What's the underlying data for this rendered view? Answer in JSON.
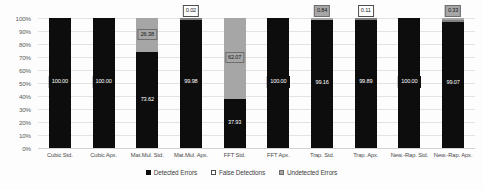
{
  "chart_data": {
    "type": "bar",
    "stacked": true,
    "stack_total": 100,
    "title": "",
    "xlabel": "",
    "ylabel": "",
    "ylim": [
      0,
      100
    ],
    "grid": true,
    "legend_position": "bottom",
    "y_ticks": [
      "0%",
      "10%",
      "20%",
      "30%",
      "40%",
      "50%",
      "60%",
      "70%",
      "80%",
      "90%",
      "100%"
    ],
    "categories": [
      "Cubic Std.",
      "Cubic Apx.",
      "Mat.Mul. Std.",
      "Mat.Mul. Apx.",
      "FFT Std.",
      "FFT Apx.",
      "Trap. Std.",
      "Trap. Apx.",
      "New.-Rap. Std.",
      "New.-Rap. Apx."
    ],
    "series": [
      {
        "name": "Detected Errors",
        "color": "#0d0d0d",
        "values": [
          100.0,
          100.0,
          73.62,
          99.98,
          37.93,
          100.0,
          99.16,
          99.89,
          100.0,
          99.07
        ]
      },
      {
        "name": "False Detections",
        "color": "#ffffff",
        "values": [
          0,
          0,
          0,
          0.02,
          0,
          0,
          0,
          0.11,
          0,
          0.6
        ]
      },
      {
        "name": "Undetected Errors",
        "color": "#a6a6a6",
        "values": [
          0,
          0,
          26.38,
          0,
          62.07,
          0,
          0.84,
          0,
          0,
          0.33
        ]
      }
    ],
    "bars": [
      {
        "category": "Cubic Std.",
        "segments": [
          {
            "series": "Detected Errors",
            "value": 100.0,
            "label": "100.00"
          }
        ]
      },
      {
        "category": "Cubic Apx.",
        "segments": [
          {
            "series": "Detected Errors",
            "value": 100.0,
            "label": "100.00"
          }
        ]
      },
      {
        "category": "Mat.Mul. Std.",
        "segments": [
          {
            "series": "Detected Errors",
            "value": 73.62,
            "label": "73.62"
          },
          {
            "series": "Undetected Errors",
            "value": 26.38,
            "label": "26.38"
          }
        ]
      },
      {
        "category": "Mat.Mul. Apx.",
        "segments": [
          {
            "series": "Detected Errors",
            "value": 99.98,
            "label": "99.98"
          },
          {
            "series": "False Detections",
            "value": 0.02,
            "label": "0.02"
          }
        ]
      },
      {
        "category": "FFT Std.",
        "segments": [
          {
            "series": "Detected Errors",
            "value": 37.93,
            "label": "37.93"
          },
          {
            "series": "Undetected Errors",
            "value": 62.07,
            "label": "62.07"
          }
        ]
      },
      {
        "category": "FFT Apx.",
        "segments": [
          {
            "series": "Detected Errors",
            "value": 100.0,
            "label": "100.00"
          }
        ]
      },
      {
        "category": "Trap. Std.",
        "segments": [
          {
            "series": "Detected Errors",
            "value": 99.16,
            "label": "99.16"
          },
          {
            "series": "Undetected Errors",
            "value": 0.84,
            "label": "0.84"
          }
        ]
      },
      {
        "category": "Trap. Apx.",
        "segments": [
          {
            "series": "Detected Errors",
            "value": 99.89,
            "label": "99.89"
          },
          {
            "series": "False Detections",
            "value": 0.11,
            "label": "0.11"
          }
        ]
      },
      {
        "category": "New.-Rap. Std.",
        "segments": [
          {
            "series": "Detected Errors",
            "value": 100.0,
            "label": "100.00"
          }
        ]
      },
      {
        "category": "New.-Rap. Apx.",
        "segments": [
          {
            "series": "Detected Errors",
            "value": 99.07,
            "label": "99.07"
          },
          {
            "series": "False Detections",
            "value": 0.6,
            "label": "0.60"
          },
          {
            "series": "Undetected Errors",
            "value": 0.33,
            "label": "0.33"
          }
        ]
      }
    ]
  },
  "legend": {
    "items": [
      {
        "label": "Detected Errors",
        "swatch": "detected"
      },
      {
        "label": "False Detections",
        "swatch": "false"
      },
      {
        "label": "Undetected Errors",
        "swatch": "undetected"
      }
    ]
  }
}
